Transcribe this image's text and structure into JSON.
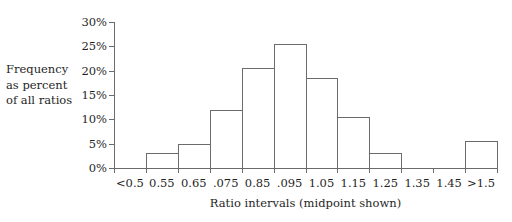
{
  "chart_data": {
    "type": "bar",
    "title": "",
    "subtitle": "",
    "xlabel": "Ratio intervals (midpoint shown)",
    "ylabel": "Frequency as percent of all ratios",
    "ylabel_lines": [
      "Frequency",
      "as percent",
      "of all ratios"
    ],
    "categories": [
      "<0.5",
      "0.55",
      "0.65",
      ".075",
      "0.85",
      ".095",
      "1.05",
      "1.15",
      "1.25",
      "1.35",
      "1.45",
      ">1.5"
    ],
    "values": [
      0,
      3,
      5,
      12,
      20.5,
      25.5,
      18.5,
      10.5,
      3,
      0,
      0,
      5.5
    ],
    "ylim": [
      0,
      30
    ],
    "ytick_values": [
      0,
      5,
      10,
      15,
      20,
      25,
      30
    ],
    "ytick_labels": [
      "0%",
      "5%",
      "10%",
      "15%",
      "20%",
      "25%",
      "30%"
    ],
    "grid": false,
    "legend": false,
    "legend_position": "none",
    "bar_style": "outline",
    "bar_fill": "#ffffff",
    "bar_stroke": "#6b6b6b",
    "axis_color": "#6b6b6b",
    "text_color": "#1f1f1f",
    "background": "#ffffff"
  }
}
